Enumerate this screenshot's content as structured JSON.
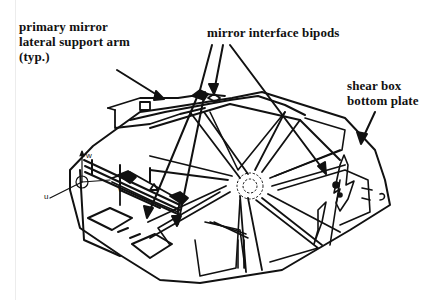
{
  "figure": {
    "colors": {
      "ink": "#111111",
      "background": "#ffffff"
    }
  },
  "callouts": {
    "lateral_arm": {
      "lines": [
        "primary mirror",
        "lateral support arm",
        "(typ.)"
      ]
    },
    "bipods": {
      "lines": [
        "mirror interface bipods"
      ]
    },
    "shear_box": {
      "lines": [
        "shear box",
        "bottom plate"
      ]
    }
  },
  "axes": {
    "u": "u",
    "v": "v",
    "w": "w"
  }
}
